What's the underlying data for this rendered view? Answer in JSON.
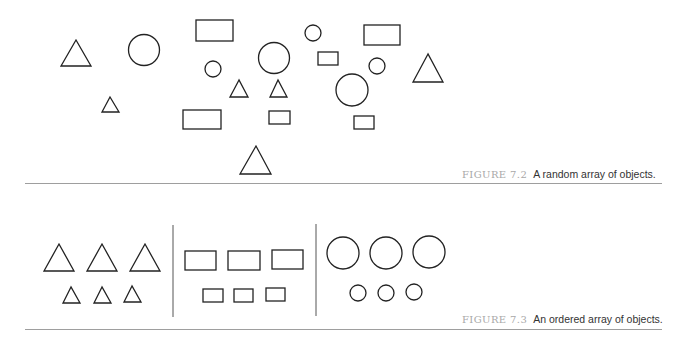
{
  "figures": [
    {
      "id": "7.2",
      "label": "FIGURE 7.2",
      "caption": "A random array of objects.",
      "stroke_color": "#222222",
      "shapes": [
        {
          "type": "triangle",
          "points": "76,40 61,66 91,66"
        },
        {
          "type": "circle",
          "cx": 144,
          "cy": 50,
          "r": 15.5
        },
        {
          "type": "rect",
          "x": 196,
          "y": 20,
          "w": 37,
          "h": 21
        },
        {
          "type": "circle",
          "cx": 213,
          "cy": 69,
          "r": 8
        },
        {
          "type": "circle",
          "cx": 274,
          "cy": 58,
          "r": 15.5
        },
        {
          "type": "circle",
          "cx": 313,
          "cy": 33,
          "r": 8
        },
        {
          "type": "rect",
          "x": 364,
          "y": 25,
          "w": 36,
          "h": 20
        },
        {
          "type": "rect",
          "x": 318,
          "y": 52,
          "w": 20,
          "h": 13
        },
        {
          "type": "circle",
          "cx": 377,
          "cy": 66,
          "r": 8
        },
        {
          "type": "triangle",
          "points": "428,54 413,82 443,82"
        },
        {
          "type": "triangle",
          "points": "239,80 230,97 248,97"
        },
        {
          "type": "triangle",
          "points": "278,80 270,97 287,97"
        },
        {
          "type": "circle",
          "cx": 352,
          "cy": 90,
          "r": 16
        },
        {
          "type": "triangle",
          "points": "110,97 102,112 119,112"
        },
        {
          "type": "rect",
          "x": 183,
          "y": 110,
          "w": 38,
          "h": 19
        },
        {
          "type": "rect",
          "x": 269,
          "y": 111,
          "w": 21,
          "h": 13
        },
        {
          "type": "rect",
          "x": 354,
          "y": 116,
          "w": 20,
          "h": 13
        },
        {
          "type": "triangle",
          "points": "256,146 240,174 271,174"
        }
      ]
    },
    {
      "id": "7.3",
      "label": "FIGURE 7.3",
      "caption": "An ordered array of objects.",
      "stroke_color": "#222222",
      "groups": [
        {
          "name": "triangles",
          "shapes": [
            {
              "type": "triangle",
              "points": "59,244 44,271 74,271"
            },
            {
              "type": "triangle",
              "points": "102,244 87,271 117,271"
            },
            {
              "type": "triangle",
              "points": "145,244 130,271 160,271"
            },
            {
              "type": "triangle",
              "points": "71,287 63,303 80,303"
            },
            {
              "type": "triangle",
              "points": "102,287 94,303 111,303"
            },
            {
              "type": "triangle",
              "points": "132,286 124,302 141,302"
            }
          ]
        },
        {
          "name": "rectangles",
          "shapes": [
            {
              "type": "rect",
              "x": 185,
              "y": 251,
              "w": 31,
              "h": 19
            },
            {
              "type": "rect",
              "x": 228,
              "y": 251,
              "w": 32,
              "h": 19
            },
            {
              "type": "rect",
              "x": 272,
              "y": 250,
              "w": 31,
              "h": 19
            },
            {
              "type": "rect",
              "x": 203,
              "y": 289,
              "w": 20,
              "h": 13
            },
            {
              "type": "rect",
              "x": 234,
              "y": 289,
              "w": 19,
              "h": 13
            },
            {
              "type": "rect",
              "x": 266,
              "y": 288,
              "w": 19,
              "h": 13
            }
          ]
        },
        {
          "name": "circles",
          "shapes": [
            {
              "type": "circle",
              "cx": 343,
              "cy": 253,
              "r": 16
            },
            {
              "type": "circle",
              "cx": 386,
              "cy": 253,
              "r": 16
            },
            {
              "type": "circle",
              "cx": 429,
              "cy": 252,
              "r": 16
            },
            {
              "type": "circle",
              "cx": 358,
              "cy": 293,
              "r": 8
            },
            {
              "type": "circle",
              "cx": 386,
              "cy": 293,
              "r": 8
            },
            {
              "type": "circle",
              "cx": 414,
              "cy": 292,
              "r": 8
            }
          ]
        }
      ],
      "dividers": [
        {
          "x": 173,
          "y1": 225,
          "y2": 317
        },
        {
          "x": 316,
          "y1": 224,
          "y2": 316
        }
      ]
    }
  ]
}
